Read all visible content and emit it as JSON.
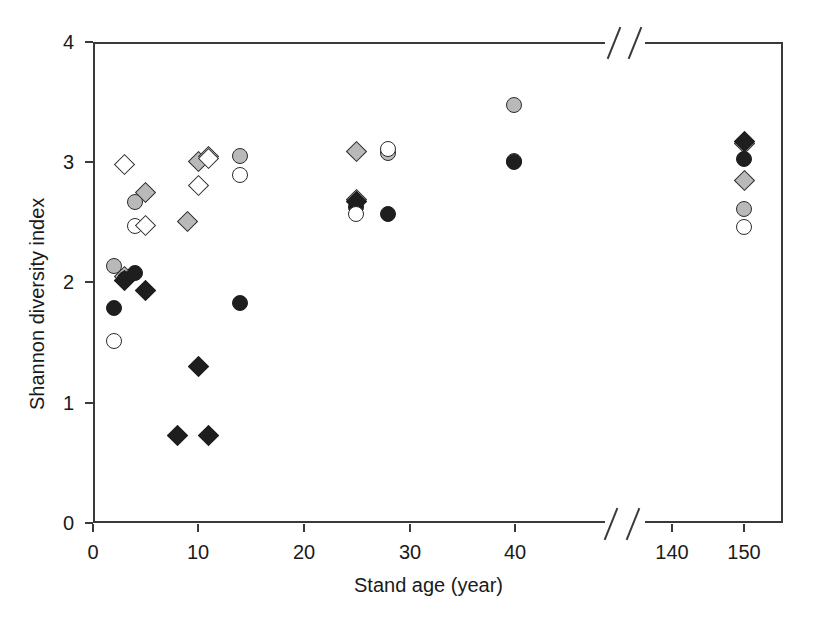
{
  "figure": {
    "background": "#ffffff",
    "axis_color": "#3a3a3a",
    "text_color": "#1a1a1a"
  },
  "chart_data": {
    "type": "scatter",
    "title": "",
    "xlabel": "Stand age (year)",
    "ylabel": "Shannon diversity index",
    "grid": false,
    "legend": "none",
    "ylim": [
      0,
      4
    ],
    "ytick_labels": [
      "0",
      "1",
      "2",
      "3",
      "4"
    ],
    "yticks": [
      0,
      1,
      2,
      3,
      4
    ],
    "xtick_labels": [
      "0",
      "10",
      "20",
      "30",
      "40",
      "140",
      "150"
    ],
    "xticks": [
      0,
      10,
      20,
      30,
      40,
      140,
      150
    ],
    "x_axis_break": {
      "present": true,
      "between": [
        45,
        135
      ],
      "style": "double-slash"
    },
    "marker_styles": [
      {
        "name": "gray-circle",
        "shape": "circle",
        "fill": "#b9b9b9",
        "edge": "#2b2b2b"
      },
      {
        "name": "gray-diamond",
        "shape": "diamond",
        "fill": "#b9b9b9",
        "edge": "#2b2b2b"
      },
      {
        "name": "black-circle",
        "shape": "circle",
        "fill": "#1e1e1e",
        "edge": "#1e1e1e"
      },
      {
        "name": "black-diamond",
        "shape": "diamond",
        "fill": "#1e1e1e",
        "edge": "#1e1e1e"
      },
      {
        "name": "open-circle",
        "shape": "circle",
        "fill": "#ffffff",
        "edge": "#2b2b2b"
      },
      {
        "name": "open-diamond",
        "shape": "diamond",
        "fill": "#ffffff",
        "edge": "#2b2b2b"
      }
    ],
    "series": [
      {
        "name": "gray-circle",
        "shape": "circle",
        "fill": "#b9b9b9",
        "points": [
          {
            "x": 2,
            "y": 2.14
          },
          {
            "x": 4,
            "y": 2.67
          },
          {
            "x": 14,
            "y": 3.05
          },
          {
            "x": 28,
            "y": 3.08
          },
          {
            "x": 40,
            "y": 3.48
          },
          {
            "x": 40,
            "y": 3.01
          },
          {
            "x": 150,
            "y": 2.61
          }
        ]
      },
      {
        "name": "gray-diamond",
        "shape": "diamond",
        "fill": "#b9b9b9",
        "points": [
          {
            "x": 3,
            "y": 2.05
          },
          {
            "x": 5,
            "y": 2.75
          },
          {
            "x": 9,
            "y": 2.51
          },
          {
            "x": 10,
            "y": 3.01
          },
          {
            "x": 11,
            "y": 3.05
          },
          {
            "x": 25,
            "y": 3.09
          },
          {
            "x": 25,
            "y": 2.69
          },
          {
            "x": 150,
            "y": 3.16
          },
          {
            "x": 150,
            "y": 2.85
          }
        ]
      },
      {
        "name": "black-circle",
        "shape": "circle",
        "fill": "#1e1e1e",
        "points": [
          {
            "x": 2,
            "y": 1.79
          },
          {
            "x": 3,
            "y": 2.03
          },
          {
            "x": 4,
            "y": 2.08
          },
          {
            "x": 14,
            "y": 1.83
          },
          {
            "x": 25,
            "y": 2.63
          },
          {
            "x": 28,
            "y": 2.57
          },
          {
            "x": 40,
            "y": 3.0
          },
          {
            "x": 150,
            "y": 3.03
          }
        ]
      },
      {
        "name": "black-diamond",
        "shape": "diamond",
        "fill": "#1e1e1e",
        "points": [
          {
            "x": 3,
            "y": 2.02
          },
          {
            "x": 5,
            "y": 1.93
          },
          {
            "x": 8,
            "y": 0.73
          },
          {
            "x": 10,
            "y": 1.3
          },
          {
            "x": 11,
            "y": 0.73
          },
          {
            "x": 25,
            "y": 2.67
          },
          {
            "x": 150,
            "y": 3.17
          }
        ]
      },
      {
        "name": "open-circle",
        "shape": "circle",
        "fill": "#ffffff",
        "points": [
          {
            "x": 2,
            "y": 1.51
          },
          {
            "x": 4,
            "y": 2.47
          },
          {
            "x": 14,
            "y": 2.89
          },
          {
            "x": 25,
            "y": 2.57
          },
          {
            "x": 28,
            "y": 3.11
          },
          {
            "x": 150,
            "y": 2.46
          }
        ]
      },
      {
        "name": "open-diamond",
        "shape": "diamond",
        "fill": "#ffffff",
        "points": [
          {
            "x": 3,
            "y": 2.98
          },
          {
            "x": 5,
            "y": 2.47
          },
          {
            "x": 10,
            "y": 2.81
          },
          {
            "x": 11,
            "y": 3.03
          }
        ]
      }
    ]
  }
}
